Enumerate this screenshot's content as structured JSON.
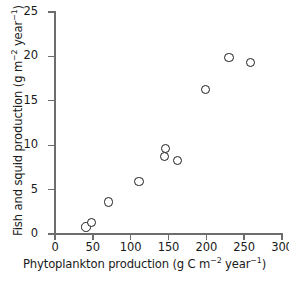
{
  "chart_data": {
    "type": "scatter",
    "title": "",
    "xlabel": "Phytoplankton production (g C m⁻² year⁻¹)",
    "ylabel": "Fish and squid production (g m⁻² year⁻¹)",
    "xlabel_parts": {
      "pre": "Phytoplankton production (g C m",
      "sup1": "−2",
      "mid": " year",
      "sup2": "−1",
      "post": ")"
    },
    "ylabel_parts": {
      "pre": "Fish and squid production (g m",
      "sup1": "−2",
      "mid": " year",
      "sup2": "−1",
      "post": ")"
    },
    "xlim": [
      0,
      300
    ],
    "ylim": [
      0,
      25
    ],
    "xticks": [
      0,
      50,
      100,
      150,
      200,
      250,
      300
    ],
    "yticks": [
      0,
      5,
      10,
      15,
      20,
      25
    ],
    "xtick_labels": [
      "0",
      "50",
      "100",
      "150",
      "200",
      "250",
      "300"
    ],
    "ytick_labels": [
      "0",
      "5",
      "10",
      "15",
      "20",
      "25"
    ],
    "grid": false,
    "legend": null,
    "marker": "open-circle",
    "marker_color": "#1c1c1c",
    "marker_fill": "#ffffff",
    "axis_color": "#6d6d6d",
    "text_color": "#1a1a1a",
    "background": "#ffffff",
    "x": [
      41,
      48,
      71,
      111,
      145,
      146,
      162,
      199,
      230,
      258
    ],
    "y": [
      0.8,
      1.3,
      3.6,
      5.9,
      8.7,
      9.6,
      8.3,
      16.3,
      19.9,
      19.3
    ],
    "points": [
      {
        "x": 41,
        "y": 0.8
      },
      {
        "x": 48,
        "y": 1.3
      },
      {
        "x": 71,
        "y": 3.6
      },
      {
        "x": 111,
        "y": 5.9
      },
      {
        "x": 145,
        "y": 8.7
      },
      {
        "x": 146,
        "y": 9.6
      },
      {
        "x": 162,
        "y": 8.3
      },
      {
        "x": 199,
        "y": 16.3
      },
      {
        "x": 230,
        "y": 19.9
      },
      {
        "x": 258,
        "y": 19.3
      }
    ]
  }
}
